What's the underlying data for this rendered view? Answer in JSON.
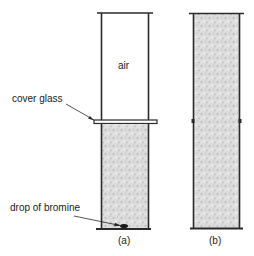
{
  "figure": {
    "labels": {
      "air": "air",
      "cover_glass": "cover glass",
      "drop_of_bromine": "drop of bromine",
      "panel_a": "(a)",
      "panel_b": "(b)"
    },
    "colors": {
      "line": "#2a2a2a",
      "gas_fill": "#d8d8d8",
      "gas_speckle": "#bdbdbd",
      "background": "#ffffff"
    }
  }
}
